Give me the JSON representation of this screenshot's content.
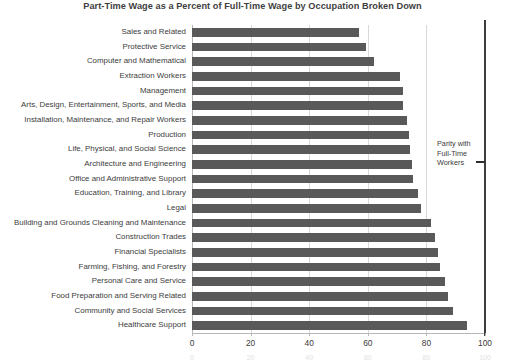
{
  "chart_data": {
    "type": "bar",
    "orientation": "horizontal",
    "title": "Part-Time Wage as a Percent of Full-Time Wage by Occupation Broken Down",
    "xlabel": "",
    "ylabel": "",
    "xlim": [
      0,
      100
    ],
    "xticks": [
      "0",
      "20",
      "40",
      "60",
      "80",
      "100"
    ],
    "grid": true,
    "legend_position": "none",
    "bar_color": "#595959",
    "gridline_color": "#d9d9d9",
    "annotations": [
      {
        "name": "parity-reference-line",
        "text_lines": [
          "Parity with",
          "Full-Time",
          "Workers"
        ],
        "value": 100,
        "marker": "dash"
      }
    ],
    "categories": [
      "Sales and Related",
      "Protective Service",
      "Computer and Mathematical",
      "Extraction Workers",
      "Management",
      "Arts, Design, Entertainment, Sports, and Media",
      "Installation, Maintenance, and Repair Workers",
      "Production",
      "Life, Physical, and Social Science",
      "Architecture and Engineering",
      "Office and Administrative Support",
      "Education, Training, and Library",
      "Legal",
      "Building and Grounds Cleaning and Maintenance",
      "Construction Trades",
      "Financial Specialists",
      "Farming, Fishing, and Forestry",
      "Personal Care and Service",
      "Food Preparation and Serving Related",
      "Community and Social Services",
      "Healthcare Support"
    ],
    "values": [
      57,
      59.5,
      62,
      71,
      72,
      72,
      73.5,
      74,
      74.5,
      75,
      75.5,
      77,
      78,
      81.5,
      83,
      84,
      84.5,
      86.5,
      87.5,
      89,
      94
    ]
  }
}
